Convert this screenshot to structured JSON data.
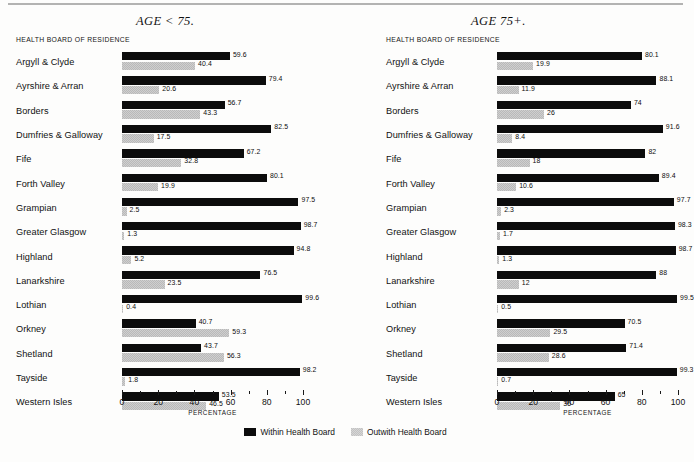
{
  "figure": {
    "axis_title": "HEALTH BOARD OF RESIDENCE",
    "xlabel": "PERCENTAGE",
    "colors": {
      "within": "#0c0c0c",
      "outwith": "#c2c2c2",
      "background": "#fdfdfc"
    }
  },
  "legend": {
    "items": [
      {
        "key": "within",
        "label": "Within Health Board"
      },
      {
        "key": "outwith",
        "label": "Outwith Health Board"
      }
    ]
  },
  "panels": [
    {
      "id": "age-lt-75",
      "title": "AGE < 75."
    },
    {
      "id": "age-75-plus",
      "title": "AGE 75+."
    }
  ],
  "axis": {
    "ticks": [
      0,
      20,
      40,
      60,
      80,
      100
    ],
    "tick_labels": [
      "0",
      "20",
      "40",
      "60",
      "80",
      "100"
    ],
    "minor_ticks": [
      10,
      30,
      50,
      70,
      90
    ],
    "min": 0,
    "max": 100
  },
  "chart_data": [
    {
      "type": "bar",
      "title": "AGE < 75.",
      "orientation": "horizontal",
      "xlabel": "PERCENTAGE",
      "ylabel": "HEALTH BOARD OF RESIDENCE",
      "xlim": [
        0,
        100
      ],
      "grid": false,
      "legend_position": "bottom-center",
      "categories": [
        "Argyll & Clyde",
        "Ayrshire & Arran",
        "Borders",
        "Dumfries & Galloway",
        "Fife",
        "Forth Valley",
        "Grampian",
        "Greater Glasgow",
        "Highland",
        "Lanarkshire",
        "Lothian",
        "Orkney",
        "Shetland",
        "Tayside",
        "Western Isles"
      ],
      "series": [
        {
          "name": "Within Health Board",
          "values": [
            59.6,
            79.4,
            56.7,
            82.5,
            67.2,
            80.1,
            97.5,
            98.7,
            94.8,
            76.5,
            99.6,
            40.7,
            43.7,
            98.2,
            53.5
          ],
          "labels": [
            "59.6",
            "79.4",
            "56.7",
            "82.5",
            "67.2",
            "80.1",
            "97.5",
            "98.7",
            "94.8",
            "76.5",
            "99.6",
            "40.7",
            "43.7",
            "98.2",
            "53.5"
          ]
        },
        {
          "name": "Outwith Health Board",
          "values": [
            40.4,
            20.6,
            43.3,
            17.5,
            32.8,
            19.9,
            2.5,
            1.3,
            5.2,
            23.5,
            0.4,
            59.3,
            56.3,
            1.8,
            46.5
          ],
          "labels": [
            "40.4",
            "20.6",
            "43.3",
            "17.5",
            "32.8",
            "19.9",
            "2.5",
            "1.3",
            "5.2",
            "23.5",
            "0.4",
            "59.3",
            "56.3",
            "1.8",
            "46.5"
          ]
        }
      ]
    },
    {
      "type": "bar",
      "title": "AGE 75+.",
      "orientation": "horizontal",
      "xlabel": "PERCENTAGE",
      "ylabel": "HEALTH BOARD OF RESIDENCE",
      "xlim": [
        0,
        100
      ],
      "grid": false,
      "legend_position": "bottom-center",
      "categories": [
        "Argyll & Clyde",
        "Ayrshire & Arran",
        "Borders",
        "Dumfries & Galloway",
        "Fife",
        "Forth Valley",
        "Grampian",
        "Greater Glasgow",
        "Highland",
        "Lanarkshire",
        "Lothian",
        "Orkney",
        "Shetland",
        "Tayside",
        "Western Isles"
      ],
      "series": [
        {
          "name": "Within Health Board",
          "values": [
            80.1,
            88.1,
            74,
            91.6,
            82,
            89.4,
            97.7,
            98.3,
            98.7,
            88,
            99.5,
            70.5,
            71.4,
            99.3,
            65
          ],
          "labels": [
            "80.1",
            "88.1",
            "74",
            "91.6",
            "82",
            "89.4",
            "97.7",
            "98.3",
            "98.7",
            "88",
            "99.5",
            "70.5",
            "71.4",
            "99.3",
            "65"
          ]
        },
        {
          "name": "Outwith Health Board",
          "values": [
            19.9,
            11.9,
            26,
            8.4,
            18,
            10.6,
            2.3,
            1.7,
            1.3,
            12,
            0.5,
            29.5,
            28.6,
            0.7,
            35
          ],
          "labels": [
            "19.9",
            "11.9",
            "26",
            "8.4",
            "18",
            "10.6",
            "2.3",
            "1.7",
            "1.3",
            "12",
            "0.5",
            "29.5",
            "28.6",
            "0.7",
            "35"
          ]
        }
      ]
    }
  ]
}
